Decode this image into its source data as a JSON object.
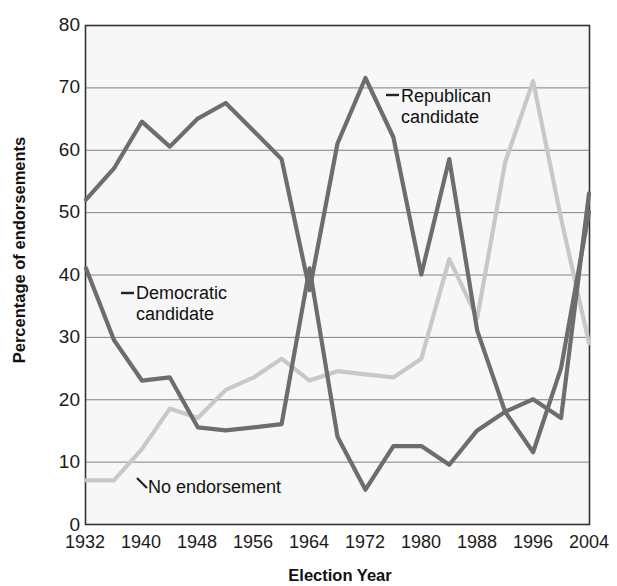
{
  "chart_data": {
    "type": "line",
    "title": "",
    "xlabel": "Election Year",
    "ylabel": "Percentage of endorsements",
    "xlim": [
      1932,
      2004
    ],
    "ylim": [
      0,
      80
    ],
    "ytick_values": [
      0,
      10,
      20,
      30,
      40,
      50,
      60,
      70,
      80
    ],
    "ytick_labels": [
      "0",
      "10",
      "20",
      "30",
      "40",
      "50",
      "60",
      "70",
      "80"
    ],
    "xtick_values": [
      1932,
      1940,
      1948,
      1956,
      1964,
      1972,
      1980,
      1988,
      1996,
      2004
    ],
    "xtick_labels": [
      "1932",
      "1940",
      "1948",
      "1956",
      "1964",
      "1972",
      "1980",
      "1988",
      "1996",
      "2004"
    ],
    "grid": "horizontal",
    "legend_position": "inline-annotations",
    "x": [
      1932,
      1936,
      1940,
      1944,
      1948,
      1952,
      1956,
      1960,
      1964,
      1968,
      1972,
      1976,
      1980,
      1984,
      1988,
      1992,
      1996,
      2000,
      2004
    ],
    "series": [
      {
        "name": "Republican candidate",
        "color": "#6d6d6d",
        "values": [
          52,
          57,
          64.5,
          60.5,
          65,
          67.5,
          63,
          58.5,
          37.5,
          61,
          71.5,
          62,
          40,
          58.5,
          31,
          18,
          20,
          17,
          53
        ]
      },
      {
        "name": "Democratic candidate",
        "color": "#6d6d6d",
        "values": [
          41,
          29.5,
          23,
          23.5,
          15.5,
          15,
          15.5,
          16,
          41,
          14,
          5.5,
          12.5,
          12.5,
          9.5,
          15,
          18,
          11.5,
          25,
          50
        ]
      },
      {
        "name": "No endorsement",
        "color": "#c8c8c8",
        "values": [
          7,
          7,
          12,
          18.5,
          17,
          21.5,
          23.5,
          26.5,
          23,
          24.5,
          24,
          23.5,
          26.5,
          42.5,
          33,
          58,
          71,
          49,
          29
        ]
      }
    ],
    "annotations": [
      {
        "label": "Republican candidate",
        "series": "Republican candidate"
      },
      {
        "label": "Democratic candidate",
        "series": "Democratic candidate"
      },
      {
        "label": "No endorsement",
        "series": "No endorsement"
      }
    ]
  },
  "axes": {
    "y_title": "Percentage of endorsements",
    "x_title": "Election Year",
    "y_ticks": [
      "80",
      "70",
      "60",
      "50",
      "40",
      "30",
      "20",
      "10",
      "0"
    ],
    "x_ticks": [
      "1932",
      "1940",
      "1948",
      "1956",
      "1964",
      "1972",
      "1980",
      "1988",
      "1996",
      "2004"
    ]
  },
  "annotations": {
    "republican_line1": "Republican",
    "republican_line2": "candidate",
    "democratic_line1": "Democratic",
    "democratic_line2": "candidate",
    "no_endorsement": "No endorsement"
  },
  "colors": {
    "dark_line": "#6d6d6d",
    "light_line": "#c8c8c8",
    "plot_bg": "#f7f7f7",
    "grid": "#808080",
    "border": "#333333"
  }
}
